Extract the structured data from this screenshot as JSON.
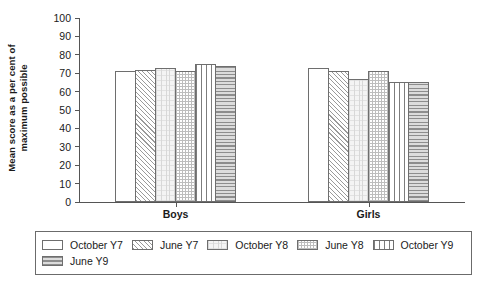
{
  "chart_data": {
    "type": "bar",
    "title": "",
    "xlabel": "",
    "ylabel": "Mean score as a per cent of maximum possible",
    "ylabel_line1": "Mean score as a per cent of",
    "ylabel_line2": "maximum possible",
    "ylim": [
      0,
      100
    ],
    "yticks": [
      100,
      90,
      80,
      70,
      60,
      50,
      40,
      30,
      20,
      10,
      0
    ],
    "grid": false,
    "legend_position": "bottom",
    "categories": [
      "Boys",
      "Girls"
    ],
    "series": [
      {
        "name": "October Y7",
        "values": [
          71,
          73
        ],
        "pattern": "blank"
      },
      {
        "name": "June Y7",
        "values": [
          72,
          71
        ],
        "pattern": "diagonal-hatch"
      },
      {
        "name": "October Y8",
        "values": [
          73,
          67
        ],
        "pattern": "light-grid"
      },
      {
        "name": "June Y8",
        "values": [
          71,
          71
        ],
        "pattern": "checker"
      },
      {
        "name": "October Y9",
        "values": [
          75,
          65
        ],
        "pattern": "vertical-dash"
      },
      {
        "name": "June Y9",
        "values": [
          74,
          65
        ],
        "pattern": "horizontal-stripe"
      }
    ]
  },
  "legend": {
    "rows": [
      [
        "October Y7",
        "June Y7",
        "October Y8",
        "June Y8",
        "October Y9"
      ],
      [
        "June Y9"
      ]
    ]
  }
}
